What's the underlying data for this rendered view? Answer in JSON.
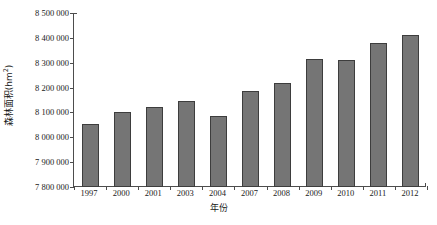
{
  "chart_data": {
    "type": "bar",
    "title": "",
    "subtitle": "",
    "xlabel": "年份",
    "ylabel": "森林面积(hm²)",
    "ylabel_base": "森林面积(hm",
    "ylabel_sup": "2",
    "ylabel_tail": ")",
    "categories": [
      "1997",
      "2000",
      "2001",
      "2003",
      "2004",
      "2007",
      "2008",
      "2009",
      "2010",
      "2011",
      "2012"
    ],
    "values": [
      8055000,
      8100000,
      8120000,
      8145000,
      8085000,
      8185000,
      8220000,
      8315000,
      8310000,
      8380000,
      8410000
    ],
    "series": [
      {
        "name": "森林面积",
        "values": [
          8055000,
          8100000,
          8120000,
          8145000,
          8085000,
          8185000,
          8220000,
          8315000,
          8310000,
          8380000,
          8410000
        ]
      }
    ],
    "ylim": [
      7800000,
      8500000
    ],
    "ytick_values": [
      7800000,
      7900000,
      8000000,
      8100000,
      8200000,
      8300000,
      8400000,
      8500000
    ],
    "ytick_labels": [
      "7 800 000",
      "7 900 000",
      "8 000 000",
      "8 100 000",
      "8 200 000",
      "8 300 000",
      "8 400 000",
      "8 500 000"
    ],
    "grid": false,
    "legend": false,
    "legend_position": "none",
    "bar_color": "#757575",
    "bar_edge_color": "#3d3d3d",
    "axis_color": "#4d4d4d",
    "background_color": "#ffffff",
    "text_color": "#1a1a1a"
  }
}
